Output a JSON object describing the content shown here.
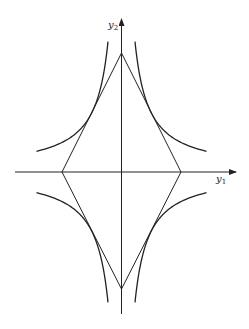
{
  "diagram": {
    "axes": {
      "x_label": "y",
      "x_label_sub": "1",
      "y_label": "y",
      "y_label_sub": "2"
    },
    "shapes": {
      "diamond": {
        "description": "rhombus with vertices on axes"
      },
      "hyperbolas": {
        "description": "four hyperbola branches |y1*y2| = const, tangent to rhombus edges"
      }
    },
    "colors": {
      "stroke": "#222222",
      "background": "#ffffff"
    }
  }
}
